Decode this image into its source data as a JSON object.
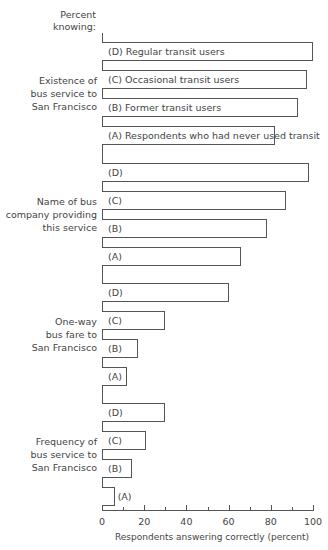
{
  "chart_data": {
    "type": "bar",
    "orientation": "horizontal",
    "title": "",
    "header_label": "Percent knowing:",
    "xlabel": "Respondents answering correctly (percent)",
    "ylabel": "Percent knowing:",
    "xlim": [
      0,
      100
    ],
    "x_ticks": [
      0,
      20,
      40,
      60,
      80,
      100
    ],
    "x_minor_ticks": [
      10,
      30,
      50,
      70,
      90
    ],
    "grid": false,
    "legend": {
      "position": "inline (first group bar labels)",
      "entries": [
        {
          "key": "D",
          "label": "(D) Regular transit users"
        },
        {
          "key": "C",
          "label": "(C) Occasional transit users"
        },
        {
          "key": "B",
          "label": "(B) Former transit users"
        },
        {
          "key": "A",
          "label": "(A) Respondents who had never used transit"
        }
      ]
    },
    "categories": [
      "Existence of bus service to San Francisco",
      "Name of bus company providing this service",
      "One-way bus fare to San Francisco",
      "Frequency of bus service to San Francisco"
    ],
    "series": [
      {
        "name": "(D) Regular transit users",
        "values": [
          100,
          98,
          60,
          30
        ]
      },
      {
        "name": "(C) Occasional transit users",
        "values": [
          97,
          87,
          30,
          21
        ]
      },
      {
        "name": "(B) Former transit users",
        "values": [
          93,
          78,
          17,
          14
        ]
      },
      {
        "name": "(A) Respondents who had never used transit",
        "values": [
          82,
          66,
          12,
          6
        ]
      }
    ]
  },
  "axis": {
    "tick_labels": [
      "0",
      "20",
      "40",
      "60",
      "80",
      "100"
    ],
    "title": "Respondents answering correctly (percent)"
  },
  "header": {
    "line1": "Percent",
    "line2": "knowing:"
  },
  "groups": [
    {
      "label_lines": [
        "Existence of",
        "bus service to",
        "San Francisco"
      ],
      "bars": [
        {
          "key": "D",
          "label": "(D) Regular transit users",
          "value": 100
        },
        {
          "key": "C",
          "label": "(C) Occasional transit users",
          "value": 97
        },
        {
          "key": "B",
          "label": "(B) Former transit users",
          "value": 93
        },
        {
          "key": "A",
          "label": "(A) Respondents who had never used transit",
          "value": 82
        }
      ]
    },
    {
      "label_lines": [
        "Name of bus",
        "company providing",
        "this service"
      ],
      "bars": [
        {
          "key": "D",
          "label": "(D)",
          "value": 98
        },
        {
          "key": "C",
          "label": "(C)",
          "value": 87
        },
        {
          "key": "B",
          "label": "(B)",
          "value": 78
        },
        {
          "key": "A",
          "label": "(A)",
          "value": 66
        }
      ]
    },
    {
      "label_lines": [
        "One-way",
        "bus fare to",
        "San Francisco"
      ],
      "bars": [
        {
          "key": "D",
          "label": "(D)",
          "value": 60
        },
        {
          "key": "C",
          "label": "(C)",
          "value": 30
        },
        {
          "key": "B",
          "label": "(B)",
          "value": 17
        },
        {
          "key": "A",
          "label": "(A)",
          "value": 12
        }
      ]
    },
    {
      "label_lines": [
        "Frequency of",
        "bus service to",
        "San Francisco"
      ],
      "bars": [
        {
          "key": "D",
          "label": "(D)",
          "value": 30
        },
        {
          "key": "C",
          "label": "(C)",
          "value": 21
        },
        {
          "key": "B",
          "label": "(B)",
          "value": 14
        },
        {
          "key": "A",
          "label": "(A)",
          "value": 6
        }
      ]
    }
  ]
}
